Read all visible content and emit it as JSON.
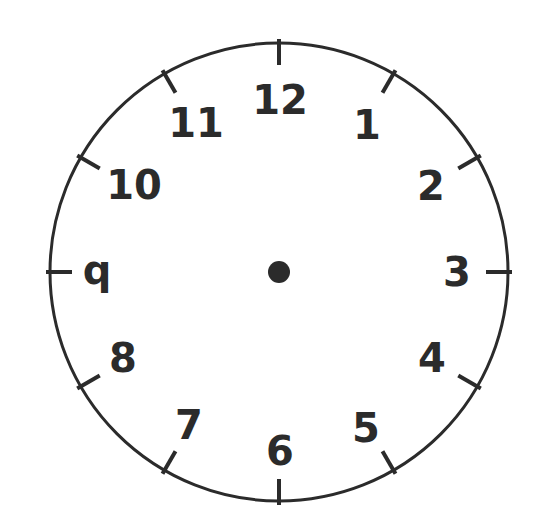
{
  "clock": {
    "center": [
      279,
      272
    ],
    "radius": 229,
    "stroke_color": "#2b2b2b",
    "face_color": "#ffffff",
    "center_dot_radius": 11,
    "tick_length": 22,
    "numbers": [
      {
        "label": "12",
        "x": 280,
        "y": 114
      },
      {
        "label": "1",
        "x": 367,
        "y": 139
      },
      {
        "label": "2",
        "x": 431,
        "y": 200
      },
      {
        "label": "3",
        "x": 457,
        "y": 286
      },
      {
        "label": "4",
        "x": 432,
        "y": 372
      },
      {
        "label": "5",
        "x": 366,
        "y": 442
      },
      {
        "label": "6",
        "x": 280,
        "y": 465
      },
      {
        "label": "7",
        "x": 189,
        "y": 439
      },
      {
        "label": "8",
        "x": 123,
        "y": 372
      },
      {
        "label": "q",
        "x": 97,
        "y": 284
      },
      {
        "label": "10",
        "x": 134,
        "y": 199
      },
      {
        "label": "11",
        "x": 196,
        "y": 137
      }
    ]
  }
}
